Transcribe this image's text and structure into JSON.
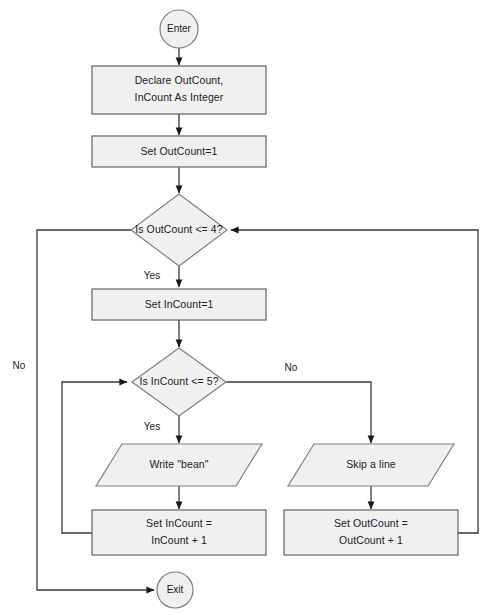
{
  "diagram": {
    "type": "flowchart",
    "title_fragment": "",
    "canvas": {
      "width": 490,
      "height": 615
    },
    "colors": {
      "shape_fill": "#f0f0f0",
      "shape_stroke": "#808080",
      "connector": "#3a3a3a",
      "text": "#1a1a1a",
      "background": "#ffffff"
    },
    "nodes": [
      {
        "id": "enter",
        "shape": "terminator",
        "label": "Enter"
      },
      {
        "id": "declare",
        "shape": "process",
        "label_line1": "Declare OutCount,",
        "label_line2": "InCount As Integer"
      },
      {
        "id": "set-outcount",
        "shape": "process",
        "label": "Set OutCount=1"
      },
      {
        "id": "outer-test",
        "shape": "decision",
        "label": "Is OutCount <= 4?"
      },
      {
        "id": "set-incount",
        "shape": "process",
        "label": "Set InCount=1"
      },
      {
        "id": "inner-test",
        "shape": "decision",
        "label": "Is InCount <= 5?"
      },
      {
        "id": "write-bean",
        "shape": "input-output",
        "label": "Write \"bean\""
      },
      {
        "id": "skip-line",
        "shape": "input-output",
        "label": "Skip a line"
      },
      {
        "id": "inc-incount",
        "shape": "process",
        "label_line1": "Set InCount =",
        "label_line2": "InCount + 1"
      },
      {
        "id": "inc-outcount",
        "shape": "process",
        "label_line1": "Set OutCount =",
        "label_line2": "OutCount + 1"
      },
      {
        "id": "exit",
        "shape": "terminator",
        "label": "Exit"
      }
    ],
    "branch_labels": {
      "outer_yes": "Yes",
      "outer_no": "No",
      "inner_yes": "Yes",
      "inner_no": "No"
    }
  }
}
